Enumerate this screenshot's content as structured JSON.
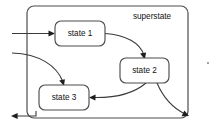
{
  "diagram": {
    "type": "uml-state-machine",
    "superstate": {
      "label": "superstate",
      "label_x": 152,
      "label_y": 17,
      "box": {
        "x": 27,
        "y": 6,
        "width": 161,
        "height": 112,
        "rx": 7
      }
    },
    "states": [
      {
        "id": "state1",
        "label": "state 1",
        "box": {
          "x": 55,
          "y": 21,
          "width": 50,
          "height": 25,
          "rx": 6
        },
        "label_x": 80,
        "label_y": 34
      },
      {
        "id": "state2",
        "label": "state 2",
        "box": {
          "x": 120,
          "y": 58,
          "width": 49,
          "height": 25,
          "rx": 6
        },
        "label_x": 144.5,
        "label_y": 71
      },
      {
        "id": "state3",
        "label": "state 3",
        "box": {
          "x": 39,
          "y": 85,
          "width": 50,
          "height": 25,
          "rx": 6
        },
        "label_x": 64,
        "label_y": 98
      }
    ],
    "transitions": [
      {
        "id": "entry-to-state1",
        "from": "external-left",
        "to": "state1",
        "kind": "entry",
        "path": "M 12 33.5 L 53 33.5",
        "arrow": {
          "x": 55,
          "y": 33.5,
          "angle": 0
        }
      },
      {
        "id": "entry-to-state3",
        "from": "external-left",
        "to": "state3",
        "kind": "entry",
        "path": "M 12 53 C 40 54 57 66 63 82",
        "arrow": {
          "x": 64,
          "y": 85,
          "angle": 72
        }
      },
      {
        "id": "state1-to-state2",
        "from": "state1",
        "to": "state2",
        "kind": "internal",
        "path": "M 105 33.5 C 126 35 140 43 144 55",
        "arrow": {
          "x": 144.5,
          "y": 58,
          "angle": 76
        }
      },
      {
        "id": "state2-to-state3",
        "from": "state2",
        "to": "state3",
        "kind": "internal",
        "path": "M 146 83 C 132 95 110 98 92 97.5",
        "arrow": {
          "x": 89,
          "y": 97.5,
          "angle": 180
        }
      },
      {
        "id": "state2-to-exit-right",
        "from": "state2",
        "to": "external-right",
        "kind": "exit",
        "path": "M 157 83 C 163 97 173 108 185 114",
        "arrow": {
          "x": 188,
          "y": 115.5,
          "angle": 27
        }
      },
      {
        "id": "exit-left",
        "from": "superstate",
        "to": "external-left",
        "kind": "exit",
        "path": "M 36 111 L 36 116 L 14 116",
        "arrow": {
          "x": 11,
          "y": 116,
          "angle": 180
        }
      }
    ],
    "decorations": [
      {
        "id": "speck",
        "x": 208,
        "y": 63,
        "r": 1.1
      }
    ],
    "colors": {
      "background": "#ffffff",
      "stroke": "#4d4d4d",
      "edge": "#3a3a3a",
      "arrow": "#1f1f1f",
      "text": "#111111",
      "speck": "#8c8c8c"
    }
  }
}
